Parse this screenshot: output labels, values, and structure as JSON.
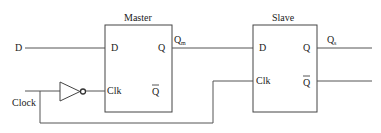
{
  "diagram": {
    "type": "master-slave D flip-flop",
    "inputs": {
      "d_label": "D",
      "clock_label": "Clock"
    },
    "master": {
      "title": "Master",
      "pin_d": "D",
      "pin_clk": "Clk",
      "pin_q": "Q",
      "pin_qbar": "Q",
      "output_label": "Q",
      "output_sub": "m"
    },
    "slave": {
      "title": "Slave",
      "pin_d": "D",
      "pin_clk": "Clk",
      "pin_q": "Q",
      "pin_qbar": "Q",
      "output_label": "Q",
      "output_sub": "s"
    },
    "inverter": {
      "name": "NOT gate"
    },
    "colors": {
      "wire": "#555555",
      "box": "#444444",
      "text": "#222222"
    }
  }
}
